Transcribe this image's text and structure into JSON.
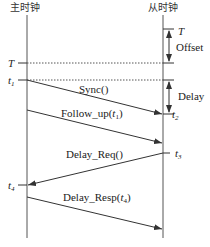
{
  "diagram": {
    "master_label": "主时钟",
    "slave_label": "从时钟",
    "time_labels": {
      "T_left": "T",
      "T_right": "T",
      "t1": "t",
      "t1_sub": "1",
      "t2": "t",
      "t2_sub": "2",
      "t3": "t",
      "t3_sub": "3",
      "t4": "t",
      "t4_sub": "4"
    },
    "brackets": {
      "offset": "Offset",
      "delay": "Delay"
    },
    "messages": [
      {
        "id": "sync",
        "label": "Sync()",
        "direction": "master-to-slave"
      },
      {
        "id": "follow_up",
        "label_prefix": "Follow_up(",
        "arg": "t",
        "arg_sub": "1",
        "label_suffix": ")",
        "direction": "master-to-slave"
      },
      {
        "id": "delay_req",
        "label": "Delay_Req()",
        "direction": "slave-to-master"
      },
      {
        "id": "delay_resp",
        "label_prefix": "Delay_Resp(",
        "arg": "t",
        "arg_sub": "4",
        "label_suffix": ")",
        "direction": "master-to-slave"
      }
    ],
    "colors": {
      "line": "#444444",
      "text": "#222222"
    }
  }
}
